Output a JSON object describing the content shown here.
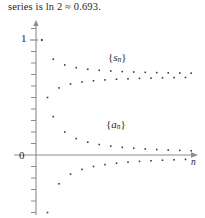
{
  "caption": {
    "text": "series is ln 2 ≈ 0.693."
  },
  "axes": {
    "y_label_one": "1",
    "y_label_zero": "0",
    "x_axis_name": "n",
    "y_axis_name": "",
    "x_range": [
      0,
      28
    ],
    "y_range": [
      -0.55,
      1.12
    ],
    "x_axis_pixel_y": 155,
    "y_axis_pixel_x": 36,
    "unit_pixels_y": 115,
    "tick_step": 0.1,
    "tick_length": 5,
    "axis_color": "#8c8c8c",
    "grid": false
  },
  "labels": {
    "sn_open": "{",
    "sn_var": "s",
    "sn_sub": "n",
    "sn_close": "}",
    "an_open": "{",
    "an_var": "a",
    "an_sub": "n",
    "an_close": "}"
  },
  "style": {
    "dot_color": "#3a3a3a",
    "dot_size": 1.6,
    "background": "#ffffff",
    "text_color": "#262626"
  },
  "chart_data": {
    "type": "scatter",
    "title": "",
    "subtitle": "",
    "xlabel": "n",
    "ylabel": "",
    "xlim": [
      0,
      28
    ],
    "ylim": [
      -0.55,
      1.12
    ],
    "grid": false,
    "legend": "inline-annotations",
    "annotations": [
      {
        "text": "{s_n}",
        "x": 15.5,
        "y": 0.86
      },
      {
        "text": "{a_n}",
        "x": 15.0,
        "y": 0.29
      }
    ],
    "x": [
      1,
      2,
      3,
      4,
      5,
      6,
      7,
      8,
      9,
      10,
      11,
      12,
      13,
      14,
      15,
      16,
      17,
      18,
      19,
      20,
      21,
      22,
      23,
      24,
      25,
      26,
      27
    ],
    "series": [
      {
        "name": "{s_n}",
        "description": "partial sums of the alternating harmonic series, converging to ln 2",
        "limit": 0.693,
        "values": [
          1.0,
          0.5,
          0.8333,
          0.5833,
          0.7833,
          0.6167,
          0.7595,
          0.6345,
          0.7456,
          0.6456,
          0.7365,
          0.6532,
          0.7301,
          0.6587,
          0.7254,
          0.6629,
          0.7216,
          0.6661,
          0.7187,
          0.6687,
          0.7163,
          0.6709,
          0.7144,
          0.6727,
          0.7127,
          0.6742,
          0.7113
        ]
      },
      {
        "name": "{a_n}",
        "description": "terms a_n = (-1)^(n-1)/n, converging to 0",
        "limit": 0.0,
        "values": [
          1.0,
          -0.5,
          0.3333,
          -0.25,
          0.2,
          -0.1667,
          0.1429,
          -0.125,
          0.1111,
          -0.1,
          0.0909,
          -0.0833,
          0.0769,
          -0.0714,
          0.0667,
          -0.0625,
          0.0588,
          -0.0556,
          0.0526,
          -0.05,
          0.0476,
          -0.0455,
          0.0435,
          -0.0417,
          0.04,
          -0.0385,
          0.037
        ]
      }
    ]
  }
}
